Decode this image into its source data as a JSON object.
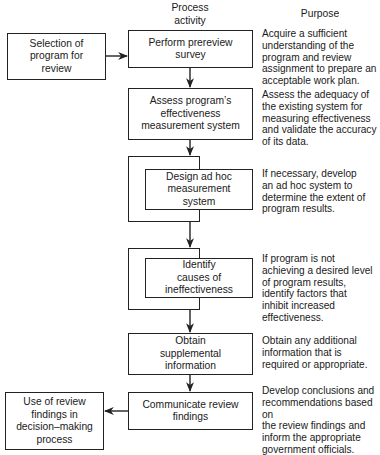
{
  "headers": {
    "process_activity": "Process\nactivity",
    "purpose": "Purpose"
  },
  "inputs": {
    "selection": "Selection of\nprogram for\nreview"
  },
  "outputs": {
    "use_of_findings": "Use of review\nfindings in\ndecision–making\nprocess"
  },
  "steps": [
    {
      "label": "Perform prereview\nsurvey",
      "purpose": "Acquire a sufficient\nunderstanding of the\nprogram and review\nassignment to prepare an\nacceptable work plan."
    },
    {
      "label": "Assess program’s\neffectiveness\nmeasurement system",
      "purpose": "Assess the adequacy of\nthe existing system for\nmeasuring effectiveness\nand validate the accuracy\nof its data."
    },
    {
      "label": "Design ad hoc\nmeasurement\nsystem",
      "purpose": "If necessary, develop\nan ad hoc system to\ndetermine the extent of\nprogram results.",
      "optional": true
    },
    {
      "label": "Identify\ncauses of\nineffectiveness",
      "purpose": "If program is not\nachieving a desired level\nof program results,\nidentify factors that\ninhibit increased\neffectiveness.",
      "optional": true
    },
    {
      "label": "Obtain\nsupplemental\ninformation",
      "purpose": "Obtain any additional\ninformation that is\nrequired or appropriate."
    },
    {
      "label": "Communicate review\nfindings",
      "purpose": "Develop conclusions and\nrecommendations based on\nthe review findings and\ninform the appropriate\ngovernment officials."
    }
  ]
}
